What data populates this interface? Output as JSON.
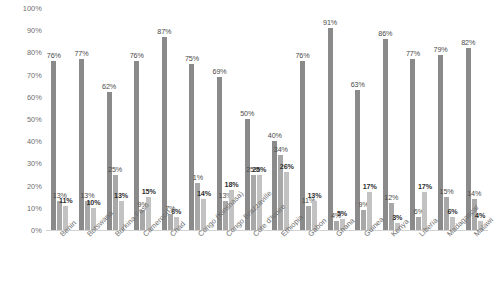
{
  "chart_data": {
    "type": "bar",
    "title": "",
    "xlabel": "",
    "ylabel": "",
    "ylim": [
      0,
      100
    ],
    "grid": false,
    "legend": "none",
    "ytick_labels": [
      "100%",
      "90%",
      "80%",
      "70%",
      "60%",
      "50%",
      "40%",
      "30%",
      "20%",
      "10%",
      "0%"
    ],
    "ytick_values": [
      100,
      90,
      80,
      70,
      60,
      50,
      40,
      30,
      20,
      10,
      0
    ],
    "categories": [
      "Benin",
      "Botswana",
      "Burkina Faso",
      "Cameroon",
      "Chad",
      "Congo (Kinshasa)",
      "Congo Brazzaville",
      "Cote d'Ivoire",
      "Ethiopia",
      "Gabon",
      "Ghana",
      "Guinea",
      "Kenya",
      "Liberia",
      "Madagascar",
      "Malawi"
    ],
    "series": [
      {
        "name": "series-1",
        "color": "#8a8a8a",
        "values": [
          76,
          77,
          62,
          76,
          87,
          75,
          69,
          50,
          40,
          76,
          91,
          63,
          86,
          77,
          79,
          82
        ],
        "labels": [
          "76%",
          "77%",
          "62%",
          "76%",
          "87%",
          "75%",
          "69%",
          "50%",
          "40%",
          "76%",
          "91%",
          "63%",
          "86%",
          "77%",
          "79%",
          "82%"
        ]
      },
      {
        "name": "series-2",
        "color": "#a8a8a8",
        "values": [
          13,
          13,
          25,
          9,
          7,
          21,
          13,
          25,
          34,
          11,
          4,
          9,
          12,
          6,
          15,
          14
        ],
        "labels": [
          "13%",
          "13%",
          "25%",
          "9%",
          "7%",
          "1%",
          "13%",
          "25%",
          "34%",
          "11%",
          "4%",
          "9%",
          "12%",
          "6%",
          "15%",
          "14%"
        ]
      },
      {
        "name": "series-3",
        "color": "#c2c2c2",
        "values": [
          11,
          10,
          13,
          15,
          6,
          14,
          18,
          25,
          26,
          13,
          5,
          17,
          3,
          17,
          6,
          4
        ],
        "labels": [
          "11%",
          "10%",
          "13%",
          "15%",
          "6%",
          "14%",
          "18%",
          "25%",
          "26%",
          "13%",
          "5%",
          "17%",
          "3%",
          "17%",
          "6%",
          "4%"
        ]
      }
    ]
  }
}
